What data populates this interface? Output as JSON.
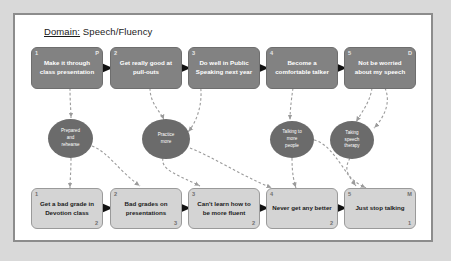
{
  "panel": {
    "title_label": "Domain:",
    "title_value": " Speech/Fluency"
  },
  "goals": [
    {
      "index": "1",
      "label": "Make it through\nclass presentation",
      "corner": "P"
    },
    {
      "index": "2",
      "label": "Get really good at\npull-outs",
      "corner": ""
    },
    {
      "index": "3",
      "label": "Do well in Public\nSpeaking next year",
      "corner": ""
    },
    {
      "index": "4",
      "label": "Become a\ncomfortable talker",
      "corner": ""
    },
    {
      "index": "5",
      "label": "Not be worried\nabout my speech",
      "corner": "D"
    }
  ],
  "fears": [
    {
      "index": "1",
      "label": "Get a bad grade in\nDevotion class",
      "corner": "",
      "count": "2"
    },
    {
      "index": "2",
      "label": "Bad grades on\npresentations",
      "corner": "",
      "count": "3"
    },
    {
      "index": "3",
      "label": "Can't learn how to\nbe more fluent",
      "corner": "",
      "count": "2"
    },
    {
      "index": "4",
      "label": "Never get any better",
      "corner": "",
      "count": "2"
    },
    {
      "index": "5",
      "label": "Just stop talking",
      "corner": "M",
      "count": "1"
    }
  ],
  "strategies": [
    {
      "label": "Prepared\nand\nrehearse"
    },
    {
      "label": "Practice\nmore"
    },
    {
      "label": "Talking to\nmore\npeople"
    },
    {
      "label": "Taking\nspeech\ntherapy"
    }
  ],
  "colors": {
    "goal_fill": "#828282",
    "fear_fill": "#d4d4d4",
    "strategy_fill": "#6b6b6b",
    "panel_border": "#8c8c8c",
    "page_background": "#d9d9d9",
    "connector": "#9b9b9b"
  }
}
